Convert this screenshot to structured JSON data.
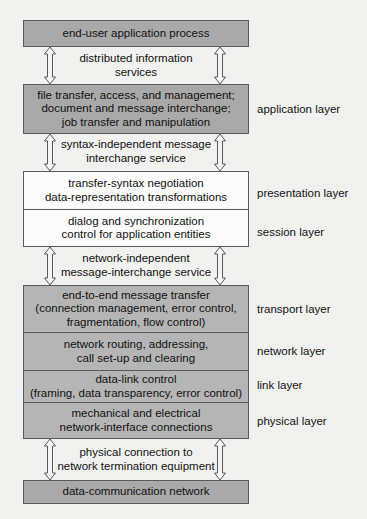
{
  "diagram": {
    "top_box": "end-user application process",
    "bottom_box": "data-communication network",
    "services": [
      [
        "distributed information",
        "services"
      ],
      [
        "syntax-independent message",
        "interchange service"
      ],
      [
        "network-independent",
        "message-interchange service"
      ],
      [
        "physical connection to",
        "network termination equipment"
      ]
    ],
    "layers": [
      {
        "name": "application layer",
        "lines": [
          "file transfer, access, and management;",
          "document and message interchange;",
          "job transfer and manipulation"
        ]
      },
      {
        "name": "presentation layer",
        "lines": [
          "transfer-syntax negotiation",
          "data-representation transformations"
        ]
      },
      {
        "name": "session layer",
        "lines": [
          "dialog and synchronization",
          "control for application entities"
        ]
      },
      {
        "name": "transport layer",
        "lines": [
          "end-to-end message transfer",
          "(connection management, error control,",
          "fragmentation, flow control)"
        ]
      },
      {
        "name": "network layer",
        "lines": [
          "network routing, addressing,",
          "call set-up and clearing"
        ]
      },
      {
        "name": "link layer",
        "lines": [
          "data-link control",
          "(framing, data transparency, error control)"
        ]
      },
      {
        "name": "physical layer",
        "lines": [
          "mechanical and electrical",
          "network-interface connections"
        ]
      }
    ],
    "colors": {
      "dark_box": "#a9a9a9",
      "gray_box": "#b5b5b5",
      "white_box": "#fbfbfb",
      "arrow_fill": "#f4f4f4",
      "outline": "#5a5a5a"
    }
  }
}
